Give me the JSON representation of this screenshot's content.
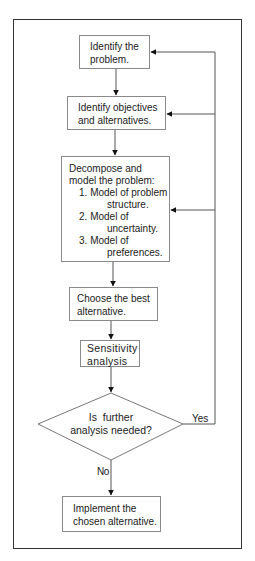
{
  "diagram": {
    "type": "flowchart",
    "nodes": {
      "identify_problem": {
        "lines": [
          "Identify the",
          "problem."
        ]
      },
      "identify_objectives": {
        "lines": [
          "Identify objectives",
          "and alternatives."
        ]
      },
      "decompose": {
        "lines": [
          "Decompose and",
          "model the problem:"
        ],
        "items": [
          {
            "num": "1.",
            "first": "Model of problem",
            "second": "structure."
          },
          {
            "num": "2.",
            "first": "Model of",
            "second": "uncertainty."
          },
          {
            "num": "3.",
            "first": "Model of",
            "second": "preferences."
          }
        ]
      },
      "choose_best": {
        "lines": [
          "Choose the best",
          "alternative."
        ]
      },
      "sensitivity": {
        "lines": [
          "Sensitivity",
          "analysis"
        ]
      },
      "decision": {
        "lines": [
          "Is  further",
          "analysis needed?"
        ]
      },
      "implement": {
        "lines": [
          "Implement the",
          "chosen alternative."
        ]
      }
    },
    "edge_labels": {
      "yes": "Yes",
      "no": "No"
    },
    "colors": {
      "frame": "#333333",
      "box_border": "#8a8a8a",
      "line": "#555555",
      "arrow": "#111111",
      "text": "#222222"
    }
  }
}
